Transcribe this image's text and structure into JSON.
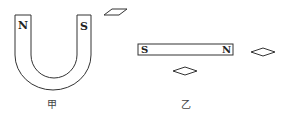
{
  "figure": {
    "horseshoe_magnet": {
      "caption": "甲",
      "left_pole": "N",
      "right_pole": "S"
    },
    "bar_magnet": {
      "caption": "乙",
      "left_pole": "S",
      "right_pole": "N"
    },
    "compass_needles": [
      {
        "id": "near-horseshoe",
        "shape": "parallelogram"
      },
      {
        "id": "right-of-bar",
        "shape": "diamond"
      },
      {
        "id": "below-bar",
        "shape": "diamond"
      }
    ],
    "colors": {
      "stroke": "#333333",
      "background": "#ffffff"
    }
  }
}
